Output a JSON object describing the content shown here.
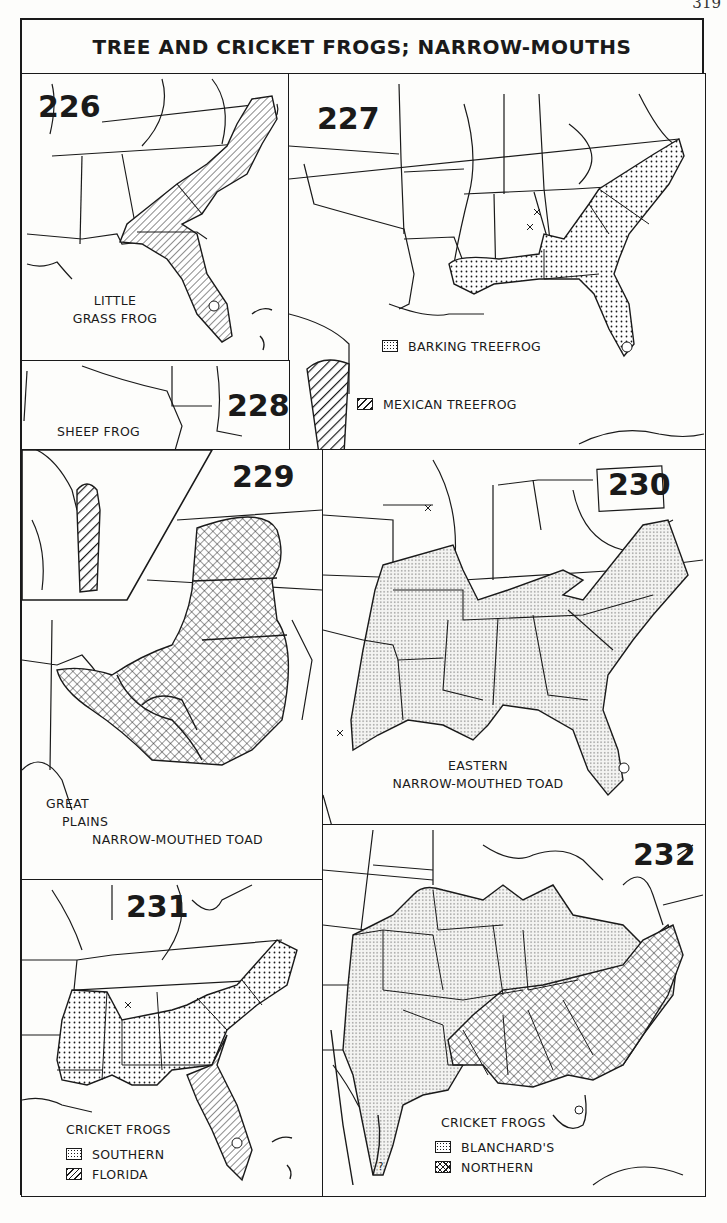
{
  "page": {
    "number": "319"
  },
  "title": "TREE AND CRICKET FROGS; NARROW-MOUTHS",
  "maps": [
    {
      "id": "226",
      "label_lines": [
        "LITTLE",
        "GRASS FROG"
      ],
      "pattern": "fine-diagonal-hatch"
    },
    {
      "id": "227",
      "legend": [
        {
          "pattern": "dots",
          "label": "BARKING TREEFROG"
        },
        {
          "pattern": "bold-diagonal-hatch",
          "label": "MEXICAN TREEFROG"
        }
      ]
    },
    {
      "id": "228",
      "label_lines": [
        "SHEEP FROG"
      ],
      "pattern": "bold-diagonal-hatch"
    },
    {
      "id": "229",
      "label_lines": [
        "GREAT",
        "PLAINS",
        "NARROW-MOUTHED TOAD"
      ],
      "pattern": "crosshatch"
    },
    {
      "id": "230",
      "label_lines": [
        "EASTERN",
        "NARROW-MOUTHED TOAD"
      ],
      "pattern": "fine-dots"
    },
    {
      "id": "231",
      "legend_title": "CRICKET FROGS",
      "legend": [
        {
          "pattern": "dots",
          "label": "SOUTHERN"
        },
        {
          "pattern": "fine-diagonal-hatch",
          "label": "FLORIDA"
        }
      ]
    },
    {
      "id": "232",
      "legend_title": "CRICKET FROGS",
      "legend": [
        {
          "pattern": "fine-dots",
          "label": "BLANCHARD'S"
        },
        {
          "pattern": "crosshatch",
          "label": "NORTHERN"
        }
      ]
    }
  ],
  "markers": {
    "x_symbol": "×",
    "question": "?"
  }
}
